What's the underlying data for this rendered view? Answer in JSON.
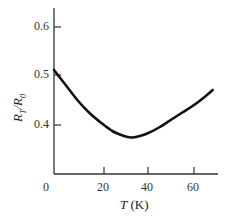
{
  "chart_data": {
    "type": "line",
    "title": "",
    "xlabel": "T (K)",
    "xlabel_var": "T",
    "xlabel_unit": "(K)",
    "ylabel": "R_T/R_0",
    "xlim": [
      0,
      70
    ],
    "ylim": [
      0.3,
      0.65
    ],
    "x_ticks": [
      "0",
      "20",
      "40",
      "60"
    ],
    "y_ticks": [
      "0.4",
      "0.5",
      "0.6"
    ],
    "grid": false,
    "legend": null,
    "series": [
      {
        "name": "R_T/R_0",
        "x": [
          0,
          5,
          10,
          15,
          20,
          25,
          30,
          33,
          36,
          40,
          45,
          50,
          55,
          60,
          65,
          68
        ],
        "y": [
          0.51,
          0.48,
          0.45,
          0.425,
          0.405,
          0.388,
          0.378,
          0.375,
          0.377,
          0.383,
          0.395,
          0.41,
          0.425,
          0.44,
          0.458,
          0.47
        ]
      }
    ]
  },
  "axes": {
    "y_tick_labels": [
      "0.6",
      "0.5",
      "0.4"
    ],
    "x_tick_labels": [
      "0",
      "20",
      "40",
      "60"
    ]
  }
}
